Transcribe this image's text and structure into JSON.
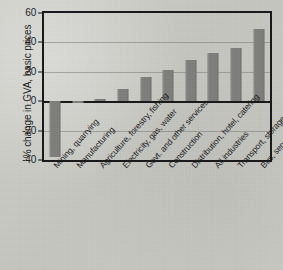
{
  "chart_data": {
    "type": "bar",
    "title": "",
    "subtitle": "",
    "xlabel": "",
    "ylabel": "% change in GVA, basic prices",
    "ylim": [
      -40,
      60
    ],
    "yticks": [
      60,
      40,
      20,
      0,
      -20,
      -40
    ],
    "ytick_labels": [
      "60",
      "40",
      "20",
      "0",
      "-20",
      "-40"
    ],
    "grid": true,
    "grid_axis": "y",
    "legend": null,
    "bar_color": "#7e7e7c",
    "categories": [
      "Mining, quarrying",
      "Manufacturing",
      "Agriculture, forestry, fishing",
      "Electricity, gas, water",
      "Govt. and other services",
      "Construction",
      "Distribution, hotel, catering",
      "All industries",
      "Transport, storage, comm.",
      "Bus, services, insurance"
    ],
    "values": [
      -38,
      -1,
      1.5,
      8.5,
      16.5,
      21,
      28,
      32.5,
      36.5,
      49
    ]
  }
}
